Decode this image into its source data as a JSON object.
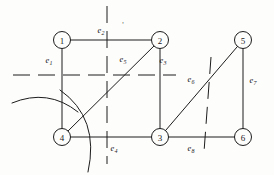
{
  "figure": {
    "stroke_color": "#1c1c1c",
    "background_color": "#fdfdfc",
    "node_radius": 8.5,
    "stray_mark": "'"
  },
  "nodes": [
    {
      "id": "1",
      "label": "1",
      "x": 62,
      "y": 40
    },
    {
      "id": "2",
      "label": "2",
      "x": 160,
      "y": 40
    },
    {
      "id": "5",
      "label": "5",
      "x": 243,
      "y": 40
    },
    {
      "id": "4",
      "label": "4",
      "x": 62,
      "y": 137
    },
    {
      "id": "3",
      "label": "3",
      "x": 160,
      "y": 137
    },
    {
      "id": "6",
      "label": "6",
      "x": 243,
      "y": 137
    }
  ],
  "edges": [
    {
      "id": "e1",
      "base": "e",
      "sub": "1",
      "from": "1",
      "to": "4",
      "label_x": 49,
      "label_y": 60
    },
    {
      "id": "e2",
      "base": "e",
      "sub": "2",
      "from": "1",
      "to": "2",
      "label_x": 101,
      "label_y": 30
    },
    {
      "id": "e3",
      "base": "e",
      "sub": "3",
      "from": "2",
      "to": "3",
      "label_x": 163,
      "label_y": 60
    },
    {
      "id": "e4",
      "base": "e",
      "sub": "4",
      "from": "4",
      "to": "3",
      "label_x": 114,
      "label_y": 148
    },
    {
      "id": "e5",
      "base": "e",
      "sub": "5",
      "from": "4",
      "to": "2",
      "label_x": 123,
      "label_y": 59
    },
    {
      "id": "e6",
      "base": "e",
      "sub": "6",
      "from": "3",
      "to": "5",
      "label_x": 191,
      "label_y": 79
    },
    {
      "id": "e7",
      "base": "e",
      "sub": "7",
      "from": "5",
      "to": "6",
      "label_x": 253,
      "label_y": 80
    },
    {
      "id": "e8",
      "base": "e",
      "sub": "8",
      "from": "3",
      "to": "6",
      "label_x": 191,
      "label_y": 148
    }
  ],
  "cut_lines": [
    {
      "id": "cut-horizontal",
      "kind": "dashed-line",
      "x1": 13,
      "y1": 75,
      "x2": 176,
      "y2": 75
    },
    {
      "id": "cut-vertical",
      "kind": "dashed-line",
      "x1": 107,
      "y1": 6,
      "x2": 107,
      "y2": 164
    },
    {
      "id": "cut-slanted",
      "kind": "dashed-line",
      "x1": 211,
      "y1": 57,
      "x2": 204,
      "y2": 152
    }
  ],
  "cut_arcs": [
    {
      "id": "arc-upper",
      "kind": "arc",
      "path": "M 12 103 Q 48 88 78 112"
    },
    {
      "id": "arc-lower",
      "kind": "arc",
      "path": "M 60 90 Q 100 118 88 172"
    }
  ]
}
